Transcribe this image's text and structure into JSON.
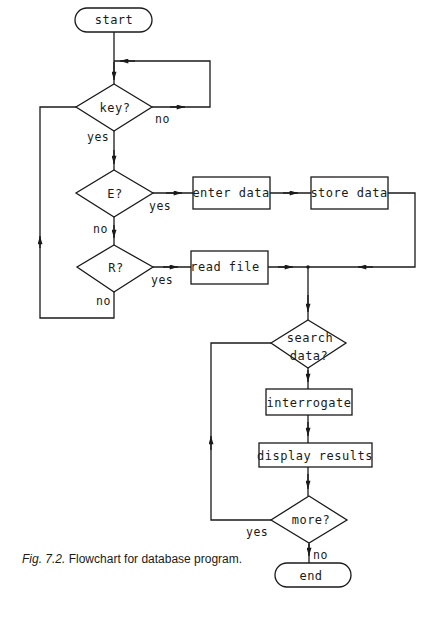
{
  "diagram": {
    "type": "flowchart",
    "nodes": {
      "start": {
        "label": "start",
        "shape": "terminator"
      },
      "key": {
        "label": "key?",
        "shape": "decision"
      },
      "e": {
        "label": "E?",
        "shape": "decision"
      },
      "r": {
        "label": "R?",
        "shape": "decision"
      },
      "enter_data": {
        "label": "enter data",
        "shape": "process"
      },
      "store_data": {
        "label": "store data",
        "shape": "process"
      },
      "read_file": {
        "label": "read file",
        "shape": "process"
      },
      "search_line1": {
        "label": "search",
        "shape": "decision"
      },
      "search_line2": {
        "label": "data?",
        "shape": "decision"
      },
      "interrogate": {
        "label": "interrogate",
        "shape": "process"
      },
      "display_results": {
        "label": "display results",
        "shape": "process"
      },
      "more": {
        "label": "more?",
        "shape": "decision"
      },
      "end": {
        "label": "end",
        "shape": "terminator"
      }
    },
    "edge_labels": {
      "key_no": "no",
      "key_yes": "yes",
      "e_yes": "yes",
      "e_no": "no",
      "r_yes": "yes",
      "r_no": "no",
      "more_yes": "yes",
      "more_no": "no"
    },
    "edges": [
      {
        "from": "start",
        "to": "key"
      },
      {
        "from": "key",
        "to": "key",
        "label": "no"
      },
      {
        "from": "key",
        "to": "e",
        "label": "yes"
      },
      {
        "from": "e",
        "to": "enter_data",
        "label": "yes"
      },
      {
        "from": "enter_data",
        "to": "store_data"
      },
      {
        "from": "store_data",
        "to": "search"
      },
      {
        "from": "e",
        "to": "r",
        "label": "no"
      },
      {
        "from": "r",
        "to": "read_file",
        "label": "yes"
      },
      {
        "from": "r",
        "to": "key",
        "label": "no"
      },
      {
        "from": "read_file",
        "to": "search"
      },
      {
        "from": "search",
        "to": "interrogate"
      },
      {
        "from": "interrogate",
        "to": "display_results"
      },
      {
        "from": "display_results",
        "to": "more"
      },
      {
        "from": "more",
        "to": "search",
        "label": "yes"
      },
      {
        "from": "more",
        "to": "end",
        "label": "no"
      }
    ]
  },
  "caption": {
    "fig": "Fig. 7.2.",
    "text": "Flowchart for database program."
  },
  "colors": {
    "ink": "#1a1a1a",
    "background": "#ffffff"
  }
}
